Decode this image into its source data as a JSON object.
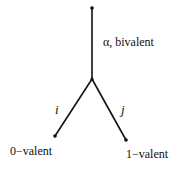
{
  "diagram": {
    "nodes": [
      {
        "id": "top",
        "x": 92,
        "y": 8
      },
      {
        "id": "junction",
        "x": 92,
        "y": 79
      },
      {
        "id": "left",
        "x": 55,
        "y": 136
      },
      {
        "id": "right",
        "x": 126,
        "y": 140
      }
    ],
    "edges": [
      {
        "from": "top",
        "to": "junction",
        "label": "α, bivalent"
      },
      {
        "from": "junction",
        "to": "left",
        "label": "i"
      },
      {
        "from": "junction",
        "to": "right",
        "label": "j"
      }
    ],
    "labels": {
      "top_edge": "α, bivalent",
      "left_edge": "i",
      "right_edge": "j",
      "left_node": "0−valent",
      "right_node": "1−valent"
    },
    "colors": {
      "line": "#111111",
      "background": "#ffffff"
    }
  }
}
